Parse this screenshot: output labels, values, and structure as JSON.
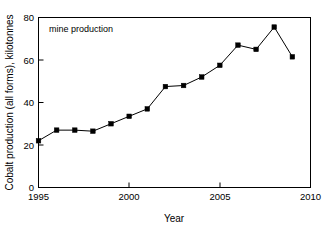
{
  "chart_data": {
    "type": "line",
    "title": "",
    "subtitle": "",
    "xlabel": "Year",
    "ylabel": "Cobalt production (all forms), kilotonnes",
    "xlim": [
      1995,
      2010
    ],
    "ylim": [
      0,
      80
    ],
    "xticks": [
      1995,
      2000,
      2005,
      2010
    ],
    "yticks": [
      0,
      20,
      40,
      60,
      80
    ],
    "xtick_labels": [
      "1995",
      "2000",
      "2005",
      "2010"
    ],
    "ytick_labels": [
      "0",
      "20",
      "40",
      "60",
      "80"
    ],
    "grid": false,
    "legend_position": "none",
    "annotations": [
      {
        "text": "mine production",
        "x": 1995.6,
        "y": 76.5
      }
    ],
    "series": [
      {
        "name": "mine production",
        "color": "#000000",
        "marker": "square",
        "x": [
          1995,
          1996,
          1997,
          1998,
          1999,
          2000,
          2001,
          2002,
          2003,
          2004,
          2005,
          2006,
          2007,
          2008,
          2009
        ],
        "values": [
          22,
          27,
          27,
          26.5,
          30,
          33.5,
          37,
          47.5,
          48,
          52,
          57.5,
          67,
          65,
          75.5,
          61.5
        ]
      }
    ]
  },
  "figure": {
    "background_color": "#ffffff",
    "axis_color": "#000000"
  }
}
